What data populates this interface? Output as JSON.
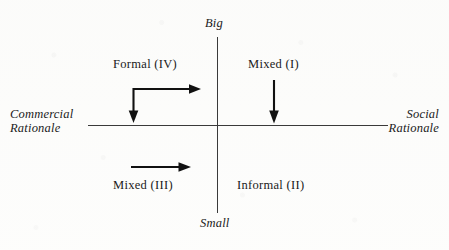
{
  "figure": {
    "kind": "two-axis quadrant diagram",
    "background_color": "#fdfdfc",
    "ink_color": "#1a1a1a"
  },
  "axes": {
    "vertical": {
      "top_label": "Big",
      "bottom_label": "Small",
      "x": 217,
      "y_top": 37,
      "y_bottom": 213
    },
    "horizontal": {
      "left_label_line1": "Commercial",
      "left_label_line2": "Rationale",
      "right_label_line1": "Social",
      "right_label_line2": "Rationale",
      "y": 125,
      "x_left": 88,
      "x_right": 388
    }
  },
  "quadrants": [
    {
      "id": "I",
      "label": "Mixed (I)",
      "position": "top-right"
    },
    {
      "id": "II",
      "label": "Informal (II)",
      "position": "bottom-right"
    },
    {
      "id": "III",
      "label": "Mixed (III)",
      "position": "bottom-left"
    },
    {
      "id": "IV",
      "label": "Formal (IV)",
      "position": "top-left"
    }
  ],
  "arrows": [
    {
      "name": "elbow-arrow-formal",
      "quadrant": "IV",
      "type": "double-headed-elbow",
      "description": "corner at top-left with one arm pointing right and one arm pointing down to the horizontal axis"
    },
    {
      "name": "down-arrow-mixed-i",
      "quadrant": "I",
      "type": "single-headed-vertical",
      "description": "arrow pointing down toward the horizontal axis"
    },
    {
      "name": "right-arrow-mixed-iii",
      "quadrant": "III",
      "type": "single-headed-horizontal",
      "description": "arrow pointing right toward the vertical axis"
    }
  ]
}
